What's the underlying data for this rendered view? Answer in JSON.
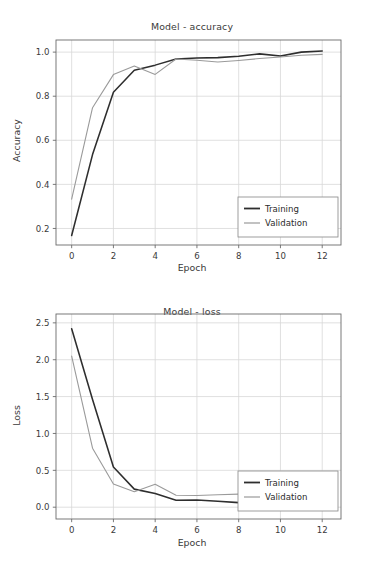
{
  "figure": {
    "width": 384,
    "height": 570,
    "background": "#ffffff",
    "panels": 2
  },
  "style": {
    "training_color": "#2e2e2e",
    "validation_color": "#9a9a9a",
    "grid_color": "#d8d8d8",
    "axis_color": "#6b6b6b",
    "text_color": "#3a3a3a",
    "legend_border": "#8c8c8c"
  },
  "chart_data": [
    {
      "type": "line",
      "title": "Model - accuracy",
      "xlabel": "Epoch",
      "ylabel": "Accuracy",
      "xlim": [
        -0.75,
        12.9
      ],
      "ylim": [
        0.125,
        1.055
      ],
      "xticks": [
        0,
        2,
        4,
        6,
        8,
        10,
        12
      ],
      "xticklabels": [
        "0",
        "2",
        "4",
        "6",
        "8",
        "10",
        "12"
      ],
      "yticks": [
        0.2,
        0.4,
        0.6,
        0.8,
        1.0
      ],
      "yticklabels": [
        "0.2",
        "0.4",
        "0.6",
        "0.8",
        "1.0"
      ],
      "grid": true,
      "legend": [
        "Training",
        "Validation"
      ],
      "legend_position": "lower right",
      "x": [
        0,
        1,
        2,
        3,
        4,
        5,
        6,
        7,
        8,
        9,
        10,
        11,
        12
      ],
      "series": [
        {
          "name": "Training",
          "color": "#2e2e2e",
          "values": [
            0.168,
            0.535,
            0.818,
            0.918,
            0.941,
            0.969,
            0.973,
            0.975,
            0.981,
            0.992,
            0.982,
            1.0,
            1.005
          ]
        },
        {
          "name": "Validation",
          "color": "#9a9a9a",
          "values": [
            0.333,
            0.748,
            0.898,
            0.937,
            0.899,
            0.969,
            0.963,
            0.955,
            0.962,
            0.971,
            0.978,
            0.986,
            0.99
          ]
        }
      ]
    },
    {
      "type": "line",
      "title": "Model - loss",
      "xlabel": "Epoch",
      "ylabel": "Loss",
      "xlim": [
        -0.75,
        12.9
      ],
      "ylim": [
        -0.16,
        2.62
      ],
      "xticks": [
        0,
        2,
        4,
        6,
        8,
        10,
        12
      ],
      "xticklabels": [
        "0",
        "2",
        "4",
        "6",
        "8",
        "10",
        "12"
      ],
      "yticks": [
        0.0,
        0.5,
        1.0,
        1.5,
        2.0,
        2.5
      ],
      "yticklabels": [
        "0.0",
        "0.5",
        "1.0",
        "1.5",
        "2.0",
        "2.5"
      ],
      "grid": true,
      "legend": [
        "Training",
        "Validation"
      ],
      "legend_position": "lower right",
      "x": [
        0,
        1,
        2,
        3,
        4,
        5,
        6,
        7,
        8,
        9
      ],
      "series": [
        {
          "name": "Training",
          "color": "#2e2e2e",
          "values": [
            2.42,
            1.46,
            0.545,
            0.245,
            0.185,
            0.095,
            0.098,
            0.082,
            0.062,
            0.04
          ]
        },
        {
          "name": "Validation",
          "color": "#9a9a9a",
          "values": [
            2.05,
            0.8,
            0.315,
            0.21,
            0.31,
            0.162,
            0.158,
            0.168,
            0.178,
            0.125
          ]
        }
      ]
    }
  ]
}
